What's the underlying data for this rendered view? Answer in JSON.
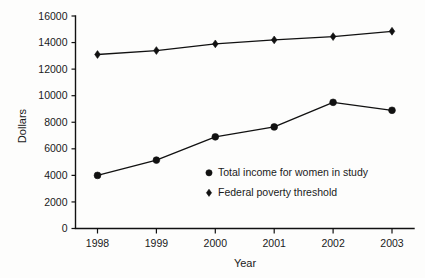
{
  "chart_data": {
    "type": "line",
    "title": "",
    "xlabel": "Year",
    "ylabel": "Dollars",
    "categories": [
      "1998",
      "1999",
      "2000",
      "2001",
      "2002",
      "2003"
    ],
    "x": [
      1998,
      1999,
      2000,
      2001,
      2002,
      2003
    ],
    "ylim": [
      0,
      16000
    ],
    "yticks": [
      0,
      2000,
      4000,
      6000,
      8000,
      10000,
      12000,
      14000,
      16000
    ],
    "ytick_labels": [
      "0",
      "2000",
      "4000",
      "6000",
      "8000",
      "10000",
      "12000",
      "14000",
      "16000"
    ],
    "grid": false,
    "legend_position": "inside-lower-center",
    "series": [
      {
        "name": "Total income for women in study",
        "marker": "circle",
        "color": "#111111",
        "values": [
          4000,
          5150,
          6900,
          7650,
          9500,
          8900
        ]
      },
      {
        "name": "Federal poverty threshold",
        "marker": "diamond",
        "color": "#111111",
        "values": [
          13100,
          13400,
          13900,
          14200,
          14450,
          14850
        ]
      }
    ]
  },
  "axes": {
    "y_axis_title": "Dollars",
    "x_axis_title": "Year"
  },
  "legend": {
    "entries": [
      {
        "label": "Total income for women in study",
        "marker": "circle-marker"
      },
      {
        "label": "Federal poverty threshold",
        "marker": "diamond-marker"
      }
    ]
  }
}
